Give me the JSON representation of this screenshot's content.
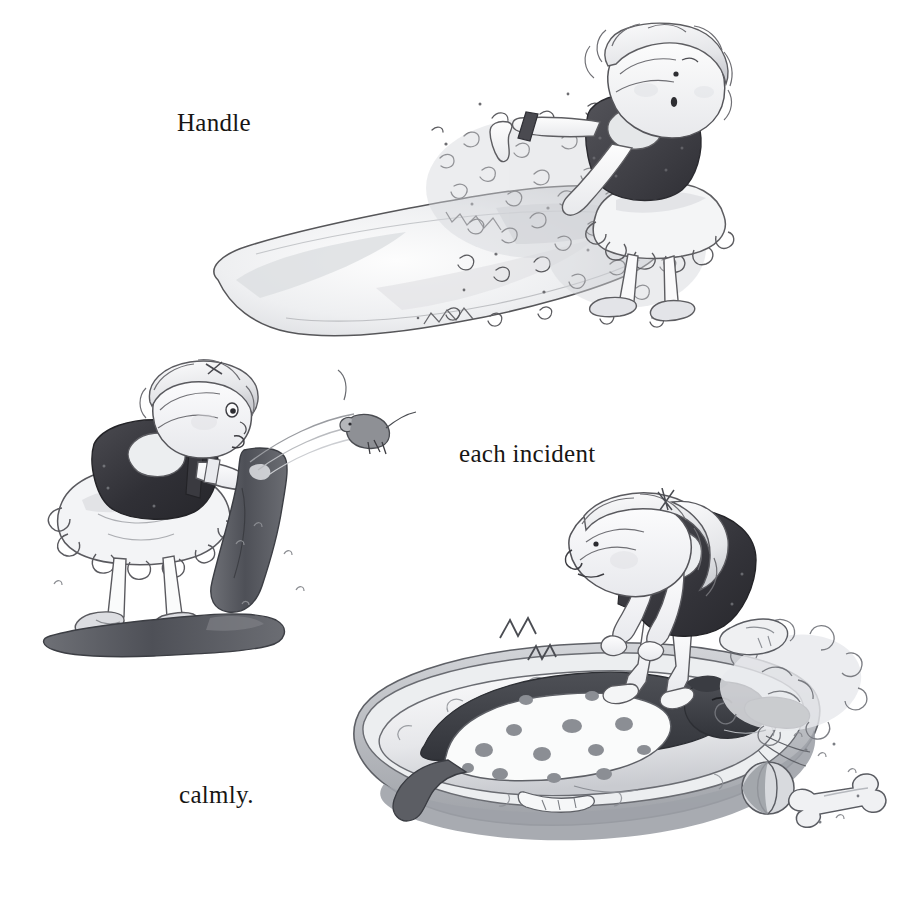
{
  "page": {
    "background_color": "#ffffff",
    "width": 917,
    "height": 922,
    "medium": "pen-and-ink with grey watercolour wash",
    "sentence": "Handle each incident calmly."
  },
  "captions": [
    {
      "id": "caption-1",
      "text": "Handle",
      "x": 177,
      "y": 110,
      "font_size_px": 25,
      "color": "#181614"
    },
    {
      "id": "caption-2",
      "text": "each incident",
      "x": 459,
      "y": 441,
      "font_size_px": 25,
      "color": "#181614"
    },
    {
      "id": "caption-3",
      "text": "calmly.",
      "x": 179,
      "y": 782,
      "font_size_px": 25,
      "color": "#181614"
    }
  ],
  "illustrations": [
    {
      "id": "illo-1",
      "name": "girl-with-burst-pillow",
      "description": "A girl in a dark sleeveless vest and white frilly tutu skirt bends forward holding a torn pillow; feathers burst out in a cloud to the left.",
      "elements": [
        "girl",
        "pillow",
        "feathers",
        "shoes",
        "hair"
      ],
      "x": 196,
      "y": 18,
      "width": 574,
      "height": 330
    },
    {
      "id": "illo-2",
      "name": "girl-with-boot-and-mouse",
      "description": "The same girl bends over holding up a dark wellington boot; a startled mouse leaps out of it in an arc. A second boot lies on the ground.",
      "elements": [
        "girl",
        "boot-held",
        "boot-on-ground",
        "mouse",
        "motion-arc"
      ],
      "x": 38,
      "y": 358,
      "width": 380,
      "height": 312
    },
    {
      "id": "illo-3",
      "name": "girl-with-dog-in-bed",
      "description": "The girl leans over a spotted dog asleep in an oval dog basket; a ball, a bone and a slipper lie nearby, with squiggle snore marks above the dog.",
      "elements": [
        "girl",
        "dog",
        "dog-bed",
        "ball",
        "bone",
        "slipper",
        "snore-squiggles"
      ],
      "x": 328,
      "y": 488,
      "width": 570,
      "height": 392
    }
  ],
  "palette": {
    "ink": "#3a3a3c",
    "ink_light": "#6e6e72",
    "wash_pale": "#e9eaec",
    "wash_mid": "#c7c9cd",
    "wash_dark": "#9a9da2",
    "vest_dark": "#4a4a4e",
    "vest_darkest": "#35353a",
    "paper": "#ffffff"
  }
}
